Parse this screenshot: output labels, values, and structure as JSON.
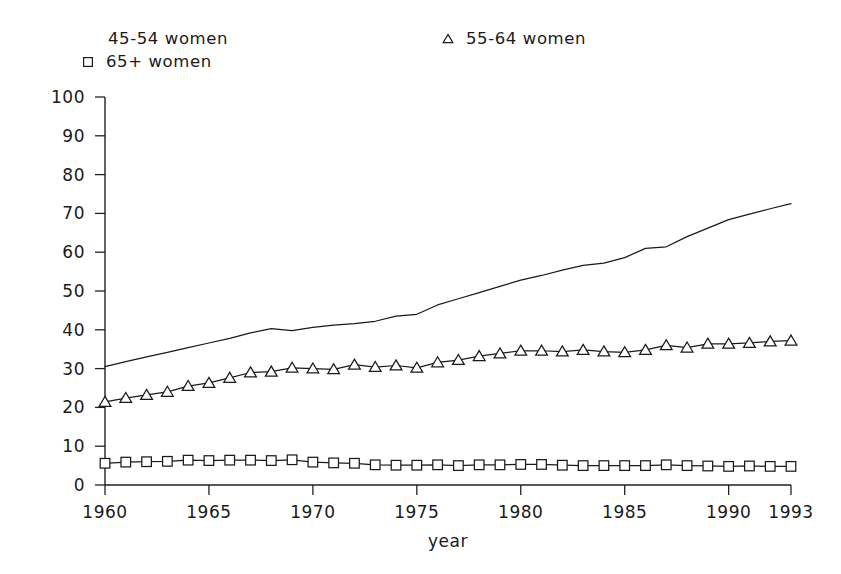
{
  "chart_data": {
    "type": "line",
    "title": "",
    "xlabel": "year",
    "ylabel": "",
    "xlim": [
      1960,
      1993
    ],
    "ylim": [
      0,
      100
    ],
    "grid": false,
    "legend_position": "top",
    "xticks": [
      1960,
      1965,
      1970,
      1975,
      1980,
      1985,
      1990,
      1993
    ],
    "yticks": [
      0,
      10,
      20,
      30,
      40,
      50,
      60,
      70,
      80,
      90,
      100
    ],
    "x": [
      1960,
      1961,
      1962,
      1963,
      1964,
      1965,
      1966,
      1967,
      1968,
      1969,
      1970,
      1971,
      1972,
      1973,
      1974,
      1975,
      1976,
      1977,
      1978,
      1979,
      1980,
      1981,
      1982,
      1983,
      1984,
      1985,
      1986,
      1987,
      1988,
      1989,
      1990,
      1991,
      1992,
      1993
    ],
    "series": [
      {
        "name": "45-54 women",
        "marker": "none",
        "values": [
          30.5,
          31.8,
          33.0,
          34.2,
          35.4,
          36.6,
          37.8,
          39.2,
          40.3,
          39.8,
          40.6,
          41.2,
          41.6,
          42.2,
          43.5,
          44.0,
          46.4,
          48.0,
          49.6,
          51.2,
          52.8,
          54.0,
          55.4,
          56.6,
          57.2,
          58.6,
          61.0,
          61.4,
          64.0,
          66.2,
          68.4,
          69.8,
          71.2,
          72.5
        ]
      },
      {
        "name": "55-64 women",
        "marker": "triangle",
        "values": [
          21.4,
          22.4,
          23.2,
          24.0,
          25.5,
          26.3,
          27.6,
          29.0,
          29.2,
          30.2,
          30.0,
          29.8,
          31.0,
          30.4,
          30.8,
          30.2,
          31.6,
          32.2,
          33.2,
          33.9,
          34.6,
          34.6,
          34.4,
          34.8,
          34.4,
          34.2,
          34.8,
          36.0,
          35.4,
          36.4,
          36.4,
          36.6,
          37.0,
          37.2
        ]
      },
      {
        "name": "65+ women",
        "marker": "square",
        "values": [
          5.6,
          5.9,
          6.0,
          6.1,
          6.4,
          6.3,
          6.4,
          6.4,
          6.3,
          6.5,
          5.9,
          5.7,
          5.6,
          5.2,
          5.1,
          5.1,
          5.2,
          5.0,
          5.2,
          5.2,
          5.3,
          5.3,
          5.1,
          5.0,
          5.0,
          5.0,
          5.0,
          5.2,
          5.0,
          4.9,
          4.8,
          4.9,
          4.8,
          4.8
        ]
      }
    ],
    "legend": [
      {
        "label": "45-54 women",
        "marker": "none"
      },
      {
        "label": "55-64 women",
        "marker": "triangle"
      },
      {
        "label": "65+ women",
        "marker": "square"
      }
    ],
    "colors": {
      "line": "#1a1a1a",
      "axis": "#222222",
      "background": "#ffffff",
      "marker_fill": "#ffffff"
    }
  }
}
